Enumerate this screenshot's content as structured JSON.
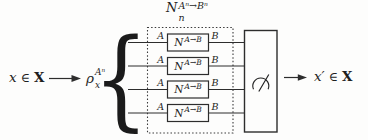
{
  "colors": {
    "ink": "#2d2d2d",
    "background": "#fdfdfc",
    "box_fill": "#fdfdfc"
  },
  "diagram": {
    "input": {
      "variable": "x",
      "element_of": "∈",
      "set": "X"
    },
    "state": {
      "base": "ρ",
      "sub": "x",
      "sup": "Aⁿ"
    },
    "brace_glyph": "{",
    "channel_bank": {
      "label": {
        "base": "N",
        "sub": "n",
        "sup": "Aⁿ→Bⁿ"
      },
      "rows": [
        {
          "input_system": "A",
          "channel": {
            "base": "N",
            "sup": "A→B"
          },
          "output_system": "B"
        },
        {
          "input_system": "A",
          "channel": {
            "base": "N",
            "sup": "A→B"
          },
          "output_system": "B"
        },
        {
          "input_system": "A",
          "channel": {
            "base": "N",
            "sup": "A→B"
          },
          "output_system": "B"
        },
        {
          "input_system": "A",
          "channel": {
            "base": "N",
            "sup": "A→B"
          },
          "output_system": "B"
        }
      ]
    },
    "measurement": {
      "icon": "meter-icon"
    },
    "output": {
      "variable": "x′",
      "element_of": "∈",
      "set": "X"
    }
  }
}
